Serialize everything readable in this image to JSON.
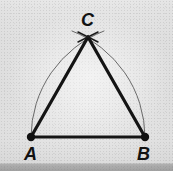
{
  "figure": {
    "background_color": "#e9e9e9",
    "ink_color": "#121212",
    "arc_color": "#555555",
    "bottom_bar_color": "#a8a8a8",
    "labels": {
      "a": "A",
      "b": "B",
      "c": "C"
    },
    "points": {
      "a": {
        "name": "A",
        "x": 31,
        "y": 137
      },
      "b": {
        "name": "B",
        "x": 145,
        "y": 137
      },
      "c": {
        "name": "C",
        "x": 88,
        "y": 37
      }
    },
    "vertex_dots": [
      {
        "name": "dot-a",
        "cx": 31,
        "cy": 137,
        "r": 4.2
      },
      {
        "name": "dot-b",
        "cx": 145,
        "cy": 137,
        "r": 4.2
      }
    ],
    "triangle_sides": [
      {
        "name": "side-ab",
        "x1": 31,
        "y1": 137,
        "x2": 145,
        "y2": 137,
        "width": 3.2
      },
      {
        "name": "side-ac",
        "x1": 31,
        "y1": 137,
        "x2": 88,
        "y2": 37,
        "width": 3.2
      },
      {
        "name": "side-bc",
        "x1": 145,
        "y1": 137,
        "x2": 88,
        "y2": 37,
        "width": 3.2
      }
    ],
    "construction_arcs": [
      {
        "name": "arc-centered-at-a",
        "center_x": 31,
        "center_y": 137,
        "radius": 114,
        "path": "M 145 137 A 114 114 0 0 0 72 31",
        "width": 0.9
      },
      {
        "name": "arc-centered-at-b",
        "center_x": 145,
        "center_y": 137,
        "radius": 114,
        "path": "M 31 137 A 114 114 0 0 1 104 31",
        "width": 0.9
      }
    ],
    "intersection_mark": {
      "name": "arc-crossing-at-c",
      "x": 88,
      "y": 37,
      "description": "X-shaped crossing of the two compass arcs at apex C"
    }
  }
}
